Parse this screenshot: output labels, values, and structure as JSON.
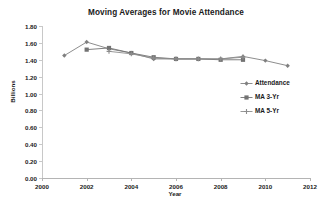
{
  "chart_data": {
    "type": "line",
    "title": "Moving Averages for Movie Attendance",
    "xlabel": "Year",
    "ylabel": "Billions",
    "xlim": [
      2000,
      2012
    ],
    "ylim": [
      0.0,
      1.8
    ],
    "xticks": [
      "2000",
      "2002",
      "2004",
      "2006",
      "2008",
      "2010",
      "2012"
    ],
    "yticks": [
      "0.00",
      "0.20",
      "0.40",
      "0.60",
      "0.80",
      "1.00",
      "1.20",
      "1.40",
      "1.60",
      "1.80"
    ],
    "grid": false,
    "legend_position": "right",
    "x": [
      2001,
      2002,
      2003,
      2004,
      2005,
      2006,
      2007,
      2008,
      2009,
      2010,
      2011
    ],
    "series": [
      {
        "name": "Attendance",
        "marker": "diamond",
        "color": "#808080",
        "x": [
          2001,
          2002,
          2003,
          2004,
          2005,
          2006,
          2007,
          2008,
          2009,
          2010,
          2011
        ],
        "values": [
          1.45,
          1.61,
          1.53,
          1.48,
          1.41,
          1.41,
          1.41,
          1.41,
          1.44,
          1.39,
          1.33
        ]
      },
      {
        "name": "MA 3-Yr",
        "marker": "square",
        "color": "#737373",
        "x": [
          2002,
          2003,
          2004,
          2005,
          2006,
          2007,
          2008,
          2009
        ],
        "values": [
          1.52,
          1.54,
          1.48,
          1.43,
          1.41,
          1.41,
          1.4,
          1.4
        ]
      },
      {
        "name": "MA 5-Yr",
        "marker": "plus",
        "color": "#8c8c8c",
        "x": [
          2003,
          2004,
          2005,
          2006,
          2007,
          2008,
          2009
        ],
        "values": [
          1.5,
          1.47,
          1.42,
          1.41,
          1.41,
          1.41,
          1.43
        ]
      }
    ]
  },
  "legend": {
    "items": [
      {
        "label": "Attendance"
      },
      {
        "label": "MA 3-Yr"
      },
      {
        "label": "MA 5-Yr"
      }
    ]
  },
  "colors": {
    "line": "#808080",
    "axis": "#c8c8c8",
    "text": "#1a1a1a",
    "background": "#ffffff"
  }
}
